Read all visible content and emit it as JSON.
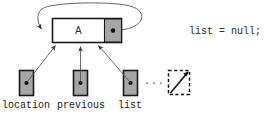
{
  "diagram": {
    "title_text": "",
    "node": {
      "data_label": "A",
      "pointer_dot": "filled-dot",
      "self_loop": "self-referencing-pointer-arrow"
    },
    "variables": [
      {
        "name": "location",
        "label": "location",
        "pointer": "filled-dot"
      },
      {
        "name": "previous",
        "label": "previous",
        "pointer": "filled-dot"
      },
      {
        "name": "list",
        "label": "list",
        "pointer": "filled-dot"
      }
    ],
    "ellipsis": "...",
    "null_box": {
      "label": "null-slash-box",
      "style": "dashed"
    },
    "code": {
      "statement": "list = null;"
    },
    "colors": {
      "cell_gray": "#a6a6a6",
      "node_fill": "#ffffff",
      "stroke": "#1a1a1a",
      "arrow": "#4a4a4a",
      "text": "#1a1a1a",
      "background": "#ffffff"
    }
  }
}
